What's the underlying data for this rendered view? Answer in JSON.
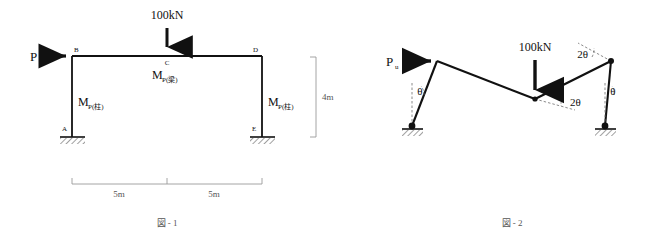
{
  "figure1": {
    "caption": "図 - 1",
    "load_label": "100kN",
    "side_force_label": "P",
    "nodes": [
      {
        "id": "A",
        "label": "A"
      },
      {
        "id": "B",
        "label": "B"
      },
      {
        "id": "C",
        "label": "C"
      },
      {
        "id": "D",
        "label": "D"
      },
      {
        "id": "E",
        "label": "E"
      }
    ],
    "moment_labels": {
      "column_left": {
        "base": "M",
        "sub": "P(柱)"
      },
      "beam_center": {
        "base": "M",
        "sub": "P(梁)"
      },
      "column_right": {
        "base": "M",
        "sub": "P(柱)"
      }
    },
    "dimensions": {
      "span_left": "5m",
      "span_right": "5m",
      "height": "4m"
    }
  },
  "figure2": {
    "caption": "図 - 2",
    "load_label": "100kN",
    "side_force_label": "P",
    "side_force_sub": "u",
    "angles": {
      "left_column": "θ",
      "center_hinge": "2θ",
      "right_joint": "2θ",
      "right_column": "θ"
    }
  },
  "colors": {
    "line": "#111111",
    "dimension": "#9a9a9a",
    "dashed_reference": "#6d6d6d",
    "caption": "#555555",
    "background": "#ffffff"
  }
}
